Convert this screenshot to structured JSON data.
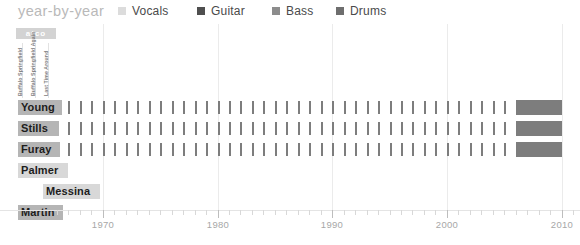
{
  "header": {
    "title": "year-by-year",
    "legend": [
      {
        "label": "Vocals",
        "color": "#dcdcdc",
        "x": 118
      },
      {
        "label": "Guitar",
        "color": "#4f4f4f",
        "x": 197
      },
      {
        "label": "Bass",
        "color": "#8c8c8c",
        "x": 272
      },
      {
        "label": "Drums",
        "color": "#6e6e6e",
        "x": 336
      }
    ]
  },
  "label_column": {
    "record_label": "atco",
    "albums": [
      {
        "name": "Buffalo Springfield",
        "x": 22
      },
      {
        "name": "Buffalo Springfield Again",
        "x": 35
      },
      {
        "name": "Last Time Around",
        "x": 48
      }
    ]
  },
  "chart_data": {
    "type": "bar",
    "title": "year-by-year",
    "xlabel": "",
    "ylabel": "",
    "xlim": [
      1966,
      2011
    ],
    "grid": true,
    "legend_position": "top-right",
    "categories": [
      "Young",
      "Stills",
      "Furay",
      "Palmer",
      "Messina",
      "Martin"
    ],
    "tick_labels": [
      "1970",
      "1980",
      "1990",
      "2000",
      "2010"
    ],
    "tick_values": [
      1970,
      1980,
      1990,
      2000,
      2010
    ],
    "minor_tick_interval": 1,
    "series": [
      {
        "name": "Young",
        "role": "Vocals/Guitar",
        "active_years": [
          1966,
          1967,
          1968,
          1969,
          1970,
          1971,
          1972,
          1973,
          1974,
          1975,
          1976,
          1977,
          1978,
          1979,
          1980,
          1981,
          1982,
          1983,
          1984,
          1985,
          1986,
          1987,
          1988,
          1989,
          1990,
          1991,
          1992,
          1993,
          1994,
          1995,
          1996,
          1997,
          1998,
          1999,
          2000,
          2001,
          2002,
          2003,
          2004,
          2005
        ],
        "block_range": [
          2006,
          2010
        ]
      },
      {
        "name": "Stills",
        "role": "Vocals/Guitar",
        "active_years": [
          1966,
          1967,
          1968,
          1969,
          1970,
          1971,
          1972,
          1973,
          1974,
          1975,
          1976,
          1977,
          1978,
          1979,
          1980,
          1981,
          1982,
          1983,
          1984,
          1985,
          1986,
          1987,
          1988,
          1989,
          1990,
          1991,
          1992,
          1993,
          1994,
          1995,
          1996,
          1997,
          1998,
          1999,
          2000,
          2001,
          2002,
          2003,
          2004,
          2005
        ],
        "block_range": [
          2006,
          2010
        ]
      },
      {
        "name": "Furay",
        "role": "Vocals/Guitar",
        "active_years": [
          1966,
          1967,
          1968,
          1969,
          1970,
          1971,
          1972,
          1973,
          1974,
          1975,
          1976,
          1977,
          1978,
          1979,
          1980,
          1981,
          1982,
          1983,
          1984,
          1985,
          1986,
          1987,
          1988,
          1989,
          1990,
          1991,
          1992,
          1993,
          1994,
          1995,
          1996,
          1997,
          1998,
          1999,
          2000,
          2001,
          2002,
          2003,
          2004,
          2005
        ],
        "block_range": [
          2006,
          2010
        ]
      },
      {
        "name": "Palmer",
        "role": "Bass",
        "active_years": [],
        "block_range": null
      },
      {
        "name": "Messina",
        "role": "Bass",
        "active_years": [],
        "block_range": null
      },
      {
        "name": "Martin",
        "role": "Drums",
        "active_years": [],
        "block_range": null
      }
    ]
  },
  "rows": [
    {
      "name": "Young",
      "top": 76,
      "name_left": 18,
      "name_width": 44,
      "light": false,
      "ticks": true,
      "block": true
    },
    {
      "name": "Stills",
      "top": 97,
      "name_left": 18,
      "name_width": 41,
      "light": false,
      "ticks": true,
      "block": true
    },
    {
      "name": "Furay",
      "top": 118,
      "name_left": 18,
      "name_width": 42,
      "light": false,
      "ticks": true,
      "block": true
    },
    {
      "name": "Palmer",
      "top": 139,
      "name_left": 18,
      "name_width": 50,
      "light": true,
      "ticks": false,
      "block": false
    },
    {
      "name": "Messina",
      "top": 160,
      "name_left": 43,
      "name_width": 57,
      "light": true,
      "ticks": false,
      "block": false
    },
    {
      "name": "Martin",
      "top": 181,
      "name_left": 18,
      "name_width": 45,
      "light": false,
      "ticks": false,
      "block": false
    }
  ],
  "axis": {
    "x_start_px": 57,
    "x_end_px": 573,
    "year_start": 1966,
    "year_end": 2011
  }
}
